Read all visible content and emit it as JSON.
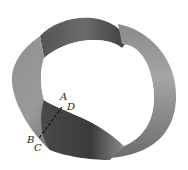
{
  "figure": {
    "cut_line": {
      "style": "dashed",
      "from_labels": [
        "A",
        "D"
      ],
      "to_labels": [
        "B",
        "C"
      ]
    },
    "labels": {
      "a": "A",
      "b": "B",
      "c": "C",
      "d": "D"
    },
    "colors": {
      "band_dark": "#3a3a3a",
      "band_mid": "#7a7a7a",
      "band_light": "#b5b5b5",
      "background": "#ffffff",
      "line": "#111111"
    }
  }
}
